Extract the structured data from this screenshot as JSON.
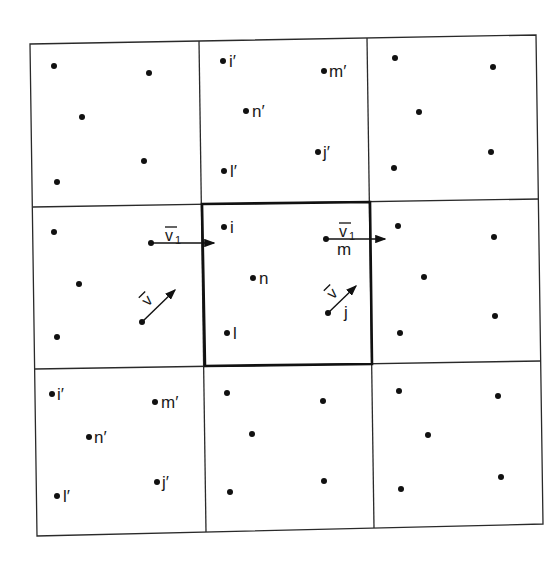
{
  "figure": {
    "grid": {
      "rows": 3,
      "cols": 3,
      "central_cell": [
        1,
        1
      ]
    },
    "colors": {
      "line": "#2a2a2a",
      "bold": "#111111",
      "background": "#ffffff"
    }
  },
  "labels": {
    "i": "i",
    "l": "l",
    "n": "n",
    "m": "m",
    "j": "j",
    "i_prime": "i′",
    "l_prime": "l′",
    "n_prime": "n′",
    "m_prime": "m′",
    "j_prime": "j′",
    "v1": "v",
    "v1_sub": "1",
    "v": "v"
  },
  "cells": [
    {
      "id": "top-left",
      "particles": [
        [
          54,
          66
        ],
        [
          149,
          73
        ],
        [
          82,
          117
        ],
        [
          144,
          161
        ],
        [
          57,
          182
        ]
      ],
      "labels": []
    },
    {
      "id": "top-center",
      "particles": [
        [
          223,
          61
        ],
        [
          324,
          71
        ],
        [
          246,
          111
        ],
        [
          318,
          152
        ],
        [
          224,
          171
        ]
      ],
      "labels": [
        "i_prime",
        "m_prime",
        "n_prime",
        "j_prime",
        "l_prime"
      ]
    },
    {
      "id": "top-right",
      "particles": [
        [
          395,
          58
        ],
        [
          493,
          67
        ],
        [
          419,
          112
        ],
        [
          491,
          152
        ],
        [
          394,
          168
        ]
      ],
      "labels": []
    },
    {
      "id": "middle-left",
      "particles": [
        [
          54,
          232
        ],
        [
          79,
          284
        ],
        [
          57,
          337
        ],
        [
          151,
          243
        ],
        [
          142,
          322
        ]
      ],
      "labels": []
    },
    {
      "id": "center",
      "particles": [
        [
          224,
          227
        ],
        [
          253,
          278
        ],
        [
          227,
          333
        ],
        [
          326,
          239
        ],
        [
          328,
          313
        ]
      ],
      "labels": [
        "i",
        "n",
        "l",
        "m",
        "j"
      ]
    },
    {
      "id": "middle-right",
      "particles": [
        [
          398,
          226
        ],
        [
          494,
          237
        ],
        [
          424,
          277
        ],
        [
          495,
          316
        ],
        [
          400,
          333
        ]
      ],
      "labels": []
    },
    {
      "id": "bottom-left",
      "particles": [
        [
          52,
          394
        ],
        [
          155,
          402
        ],
        [
          89,
          437
        ],
        [
          157,
          482
        ],
        [
          57,
          496
        ]
      ],
      "labels": [
        "i_prime",
        "m_prime",
        "n_prime",
        "j_prime",
        "l_prime"
      ]
    },
    {
      "id": "bottom-center",
      "particles": [
        [
          227,
          393
        ],
        [
          323,
          401
        ],
        [
          252,
          434
        ],
        [
          324,
          481
        ],
        [
          230,
          492
        ]
      ],
      "labels": []
    },
    {
      "id": "bottom-right",
      "particles": [
        [
          399,
          391
        ],
        [
          498,
          396
        ],
        [
          428,
          435
        ],
        [
          501,
          477
        ],
        [
          401,
          489
        ]
      ],
      "labels": []
    }
  ],
  "vectors": [
    {
      "id": "v1-left",
      "from": [
        151,
        243
      ],
      "to": [
        214,
        243
      ],
      "label": "v1"
    },
    {
      "id": "v-left",
      "from": [
        142,
        322
      ],
      "to": [
        175,
        290
      ],
      "label": "v"
    },
    {
      "id": "v1-center",
      "from": [
        326,
        239
      ],
      "to": [
        385,
        239
      ],
      "label": "v1"
    },
    {
      "id": "v-center",
      "from": [
        328,
        313
      ],
      "to": [
        356,
        286
      ],
      "label": "v"
    }
  ]
}
